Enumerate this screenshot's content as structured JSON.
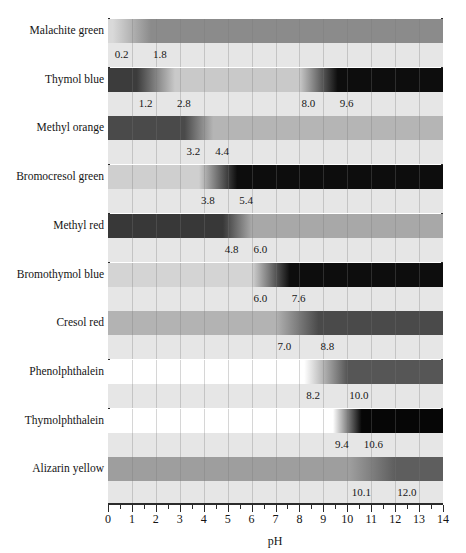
{
  "figure": {
    "title": "",
    "x_axis_title": "pH"
  },
  "axis": {
    "label": "pH",
    "min": 0,
    "max": 14,
    "tick_labels": [
      "0",
      "1",
      "2",
      "3",
      "4",
      "5",
      "6",
      "7",
      "8",
      "9",
      "10",
      "11",
      "12",
      "13",
      "14"
    ],
    "minor_ticks_per_unit": 2,
    "axis_color": "#2b2b2b"
  },
  "chart_data": {
    "type": "bar",
    "xlabel": "pH",
    "ylabel": "",
    "xlim": [
      0,
      14
    ],
    "grid": true,
    "legend_position": "none",
    "categories": [
      "Malachite green",
      "Thymol blue",
      "Methyl orange",
      "Bromocresol green",
      "Methyl red",
      "Bromothymol blue",
      "Cresol red",
      "Phenolphthalein",
      "Thymolphthalein",
      "Alizarin yellow"
    ],
    "indicators": [
      {
        "name": "Malachite green",
        "transitions": [
          {
            "low": 0.2,
            "high": 1.8,
            "low_label": "0.2",
            "high_label": "1.8",
            "acid_color": "#d9d9d9",
            "base_color": "#8b8b8b"
          }
        ]
      },
      {
        "name": "Thymol blue",
        "transitions": [
          {
            "low": 1.2,
            "high": 2.8,
            "low_label": "1.2",
            "high_label": "2.8",
            "acid_color": "#3c3c3c",
            "base_color": "#c9c9c9"
          },
          {
            "low": 8.0,
            "high": 9.6,
            "low_label": "8.0",
            "high_label": "9.6",
            "acid_color": "#c9c9c9",
            "base_color": "#0d0d0d"
          }
        ]
      },
      {
        "name": "Methyl orange",
        "transitions": [
          {
            "low": 3.2,
            "high": 4.4,
            "low_label": "3.2",
            "high_label": "4.4",
            "acid_color": "#4a4a4a",
            "base_color": "#b5b5b5"
          }
        ]
      },
      {
        "name": "Bromocresol green",
        "transitions": [
          {
            "low": 3.8,
            "high": 5.4,
            "low_label": "3.8",
            "high_label": "5.4",
            "acid_color": "#cfcfcf",
            "base_color": "#0d0d0d"
          }
        ]
      },
      {
        "name": "Methyl red",
        "transitions": [
          {
            "low": 4.8,
            "high": 6.0,
            "low_label": "4.8",
            "high_label": "6.0",
            "acid_color": "#383838",
            "base_color": "#a8a8a8"
          }
        ]
      },
      {
        "name": "Bromothymol blue",
        "transitions": [
          {
            "low": 6.0,
            "high": 7.6,
            "low_label": "6.0",
            "high_label": "7.6",
            "acid_color": "#d4d4d4",
            "base_color": "#0d0d0d"
          }
        ]
      },
      {
        "name": "Cresol red",
        "transitions": [
          {
            "low": 7.0,
            "high": 8.8,
            "low_label": "7.0",
            "high_label": "8.8",
            "acid_color": "#b3b3b3",
            "base_color": "#4a4a4a"
          }
        ]
      },
      {
        "name": "Phenolphthalein",
        "transitions": [
          {
            "low": 8.2,
            "high": 10.0,
            "low_label": "8.2",
            "high_label": "10.0",
            "acid_color": "#ffffff",
            "base_color": "#565656"
          }
        ]
      },
      {
        "name": "Thymolphthalein",
        "transitions": [
          {
            "low": 9.4,
            "high": 10.6,
            "low_label": "9.4",
            "high_label": "10.6",
            "acid_color": "#ffffff",
            "base_color": "#060606"
          }
        ]
      },
      {
        "name": "Alizarin yellow",
        "transitions": [
          {
            "low": 10.1,
            "high": 12.0,
            "low_label": "10.1",
            "high_label": "12.0",
            "acid_color": "#9e9e9e",
            "base_color": "#5e5e5e"
          }
        ]
      }
    ]
  },
  "colors": {
    "background": "#ffffff",
    "axis": "#2b2b2b",
    "strip": "#e6e6e6",
    "gridline": "#787878",
    "text": "#141414"
  }
}
